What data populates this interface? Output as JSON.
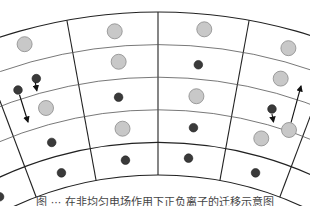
{
  "figure": {
    "type": "annular-sector grid schematic",
    "colors": {
      "grid_line": "#222222",
      "inner_grid_line": "#555555",
      "large_particle_fill": "#c8c8c8",
      "large_particle_stroke": "#8a8a8a",
      "small_particle_fill": "#3a3a3a",
      "small_particle_stroke": "#1e1e1e",
      "arrow": "#111111"
    },
    "grid": {
      "center_x": 158,
      "center_y": 520,
      "outer_radius": 508,
      "inner_radius": 345,
      "angle_span_deg": [
        -31,
        31
      ],
      "columns": 6,
      "rows": 5
    },
    "legend": {
      "large_particle": "large light-gray circle",
      "small_particle": "small dark circle"
    },
    "cells": [
      [
        "L",
        "L",
        "L",
        "L",
        "L",
        "L"
      ],
      [
        "L",
        "D",
        "L",
        "D",
        "L",
        "L"
      ],
      [
        "D",
        "L",
        "D",
        "L",
        "D",
        "L"
      ],
      [
        "D",
        "D",
        "L",
        "D",
        "L",
        "D"
      ],
      [
        "D",
        "D",
        "D",
        "D",
        "D",
        "D"
      ]
    ],
    "inner_arrows": [
      {
        "from_cell": [
          1,
          1
        ],
        "direction": "down"
      },
      {
        "from_cell": [
          2,
          4
        ],
        "direction": "down"
      }
    ],
    "outside_particles": [
      {
        "kind": "D",
        "x": 18,
        "y": 90,
        "arrow_to": [
          28,
          122
        ],
        "direction": "inward-down"
      },
      {
        "kind": "L",
        "x": 289,
        "y": 130,
        "arrow_to": [
          301,
          86
        ],
        "direction": "outward-up"
      }
    ]
  },
  "caption": {
    "text": "图 ··· 在非均匀电场作用下正负离子的迁移示意图",
    "note": "caption partially clipped at image bottom"
  }
}
